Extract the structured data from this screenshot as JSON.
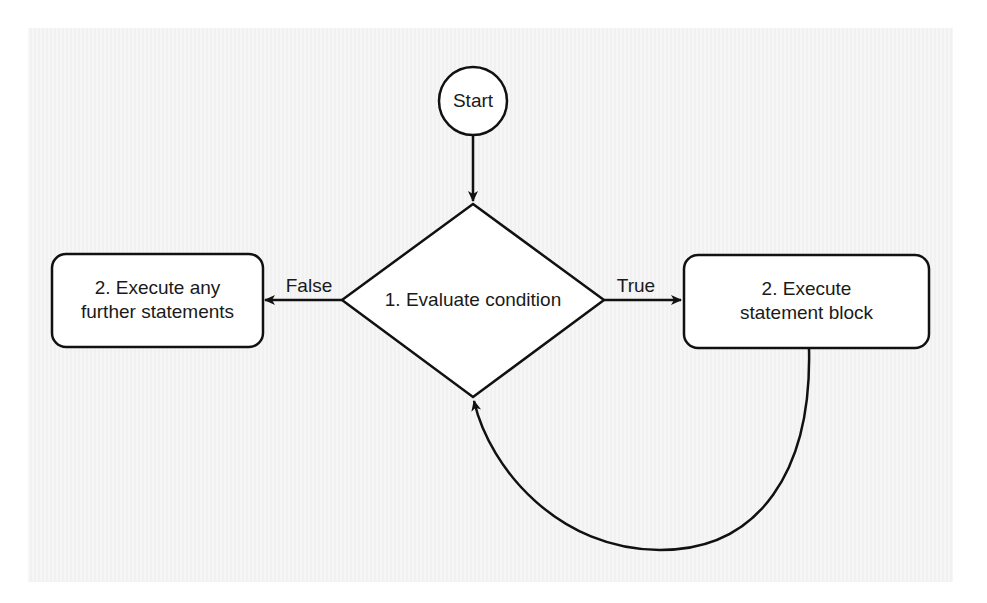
{
  "diagram": {
    "type": "flowchart",
    "nodes": {
      "start": {
        "shape": "circle",
        "label": "Start"
      },
      "condition": {
        "shape": "diamond",
        "label": "1. Evaluate condition"
      },
      "true_block": {
        "shape": "rounded-rect",
        "line1": "2. Execute",
        "line2": "statement block"
      },
      "false_block": {
        "shape": "rounded-rect",
        "line1": "2. Execute any",
        "line2": "further statements"
      }
    },
    "edges": [
      {
        "from": "start",
        "to": "condition",
        "label": ""
      },
      {
        "from": "condition",
        "to": "true_block",
        "label": "True"
      },
      {
        "from": "condition",
        "to": "false_block",
        "label": "False"
      },
      {
        "from": "true_block",
        "to": "condition",
        "label": ""
      }
    ],
    "edge_labels": {
      "true": "True",
      "false": "False"
    },
    "colors": {
      "stroke": "#111111",
      "fill": "#ffffff",
      "background": "#f3f3f3"
    }
  }
}
